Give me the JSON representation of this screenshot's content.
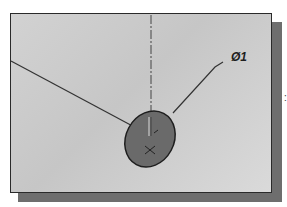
{
  "figure": {
    "type": "cad-sketch-view",
    "dimension_label": "Ø1",
    "side_mark": ":",
    "colors": {
      "panel_background": "#cdcdcd",
      "panel_border": "#2a2a2a",
      "shadow": "#6e6e6e",
      "ellipse_fill": "#6a6a6a",
      "line": "#333333"
    }
  }
}
